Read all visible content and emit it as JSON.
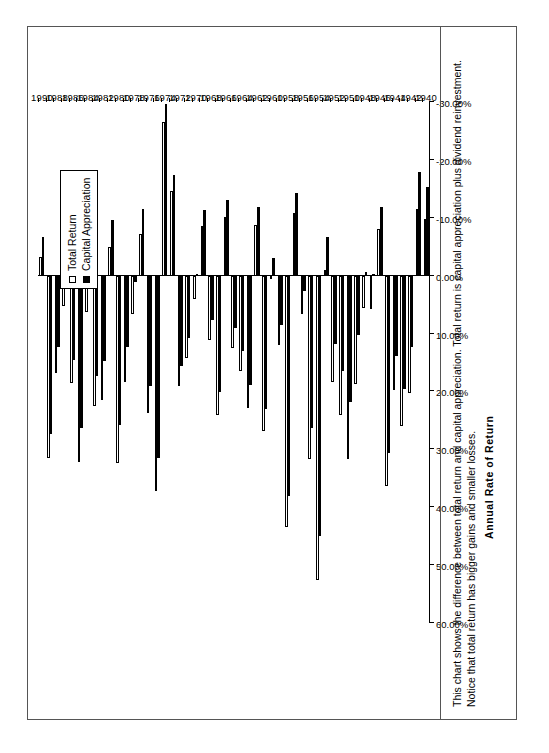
{
  "figure": {
    "title": "Figure 5.1  Difference Between Total Return and Capital Appreciation",
    "caption": "This chart shows the difference between total return and capital appreciation.  Total return is capital appreciation plus dividend reinvestment.  Notice that total return has bigger gains and smaller losses."
  },
  "legend": {
    "position": "inside-top-left",
    "items": [
      {
        "label": "Total Return",
        "marker": "hollow-square",
        "color": "#ffffff"
      },
      {
        "label": "Capital  Appreciation",
        "marker": "filled-square",
        "color": "#000000"
      }
    ]
  },
  "axes": {
    "value_axis_title": "Annual  Rate  of  Return",
    "value_ticks": [
      "60.00%",
      "50.00%",
      "40.00%",
      "30.00%",
      "20.00%",
      "10.00%",
      "0.00%",
      "-10.00%",
      "-20.00%",
      "-30.00%"
    ],
    "category_axis_title": ""
  },
  "chart_data": {
    "type": "bar",
    "orientation": "horizontal",
    "title": "Figure 5.1  Difference Between Total Return and Capital Appreciation",
    "xlabel": "Annual  Rate  of  Return",
    "ylabel": "",
    "xlim": [
      -30,
      60
    ],
    "xticks": [
      60,
      50,
      40,
      30,
      20,
      10,
      0,
      -10,
      -20,
      -30
    ],
    "xtick_labels": [
      "60.00%",
      "50.00%",
      "40.00%",
      "30.00%",
      "20.00%",
      "10.00%",
      "0.00%",
      "-10.00%",
      "-20.00%",
      "-30.00%"
    ],
    "grid": false,
    "legend_position": "upper-left-inside",
    "categories": [
      1940,
      1941,
      1942,
      1943,
      1944,
      1945,
      1946,
      1947,
      1948,
      1949,
      1950,
      1951,
      1952,
      1953,
      1954,
      1955,
      1956,
      1957,
      1958,
      1959,
      1960,
      1961,
      1962,
      1963,
      1964,
      1965,
      1966,
      1967,
      1968,
      1969,
      1970,
      1971,
      1972,
      1973,
      1974,
      1975,
      1976,
      1977,
      1978,
      1979,
      1980,
      1981,
      1982,
      1983,
      1984,
      1985,
      1986,
      1987,
      1988,
      1989,
      1990
    ],
    "category_tick_labels": [
      1940,
      1942,
      1944,
      1946,
      1948,
      1950,
      1952,
      1954,
      1956,
      1958,
      1960,
      1962,
      1964,
      1966,
      1968,
      1970,
      1972,
      1974,
      1976,
      1978,
      1980,
      1982,
      1984,
      1986,
      1988,
      1990
    ],
    "series": [
      {
        "name": "Total Return",
        "style": "hollow-square",
        "values": [
          -9.8,
          -11.6,
          20.3,
          25.9,
          19.8,
          36.4,
          -8.1,
          5.7,
          5.5,
          18.8,
          31.7,
          24.0,
          18.4,
          -1.0,
          52.6,
          31.6,
          6.6,
          -10.8,
          43.4,
          12.0,
          0.5,
          26.9,
          -8.7,
          22.8,
          16.5,
          12.5,
          -10.1,
          24.0,
          11.1,
          -8.5,
          4.0,
          14.3,
          19.0,
          -14.7,
          -26.5,
          37.2,
          23.8,
          -7.2,
          6.6,
          18.4,
          32.4,
          -4.9,
          21.4,
          22.5,
          6.3,
          32.2,
          18.5,
          5.2,
          16.8,
          31.5,
          -3.2
        ]
      },
      {
        "name": "Capital  Appreciation",
        "style": "filled-square",
        "values": [
          -15.3,
          -17.9,
          12.4,
          19.5,
          13.8,
          30.7,
          -11.9,
          0.0,
          -0.7,
          10.3,
          21.8,
          16.5,
          11.8,
          -6.6,
          45.0,
          26.4,
          2.6,
          -14.3,
          38.1,
          8.5,
          -3.0,
          23.1,
          -11.8,
          18.9,
          13.0,
          9.1,
          -13.1,
          20.1,
          7.7,
          -11.4,
          0.1,
          10.8,
          15.6,
          -17.4,
          -29.7,
          31.5,
          19.1,
          -11.5,
          1.1,
          12.3,
          25.8,
          -9.7,
          14.8,
          17.3,
          1.4,
          26.3,
          14.6,
          2.0,
          12.4,
          27.3,
          -6.6
        ]
      }
    ]
  }
}
